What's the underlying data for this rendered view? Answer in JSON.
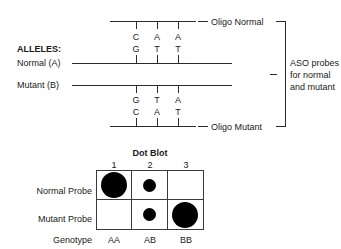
{
  "diagram": {
    "alleles_label": "ALLELES:",
    "normal_allele_label": "Normal (A)",
    "mutant_allele_label": "Mutant (B)",
    "oligo_normal_label": "Oligo Normal",
    "oligo_mutant_label": "Oligo Mutant",
    "bracket_label_line1": "ASO probes",
    "bracket_label_line2": "for normal",
    "bracket_label_line3": "and mutant",
    "oligo_normal_bases": [
      "C",
      "A",
      "A"
    ],
    "normal_allele_bases": [
      "G",
      "T",
      "T"
    ],
    "mutant_allele_bases": [
      "G",
      "T",
      "A"
    ],
    "oligo_mutant_bases": [
      "C",
      "A",
      "T"
    ]
  },
  "dot_blot": {
    "title": "Dot Blot",
    "column_numbers": [
      "1",
      "2",
      "3"
    ],
    "row_labels": [
      "Normal Probe",
      "Mutant Probe"
    ],
    "genotype_label": "Genotype",
    "genotypes": [
      "AA",
      "AB",
      "BB"
    ],
    "cells": [
      [
        "large",
        "small",
        "none"
      ],
      [
        "none",
        "small",
        "large"
      ]
    ]
  },
  "colors": {
    "line": "#2b2b2b",
    "grid": "#3a3a3a",
    "dot": "#000000",
    "text": "#1a1a1a",
    "background": "#ffffff"
  }
}
